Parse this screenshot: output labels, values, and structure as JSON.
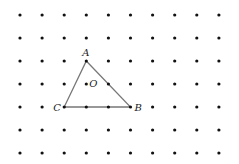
{
  "grid": {
    "cols": 10,
    "rows": 7,
    "x0": 20,
    "y0": 15,
    "dx": 22.1,
    "dy": 23,
    "dot_color": "#111"
  },
  "triangle": {
    "line_color": "#777",
    "vertices": [
      {
        "name": "A",
        "col": 3,
        "row": 2,
        "label_dx": -4,
        "label_dy": -5
      },
      {
        "name": "B",
        "col": 5,
        "row": 4,
        "label_dx": 4,
        "label_dy": 4
      },
      {
        "name": "C",
        "col": 2,
        "row": 4,
        "label_dx": -11,
        "label_dy": 4
      }
    ]
  },
  "point_O": {
    "name": "O",
    "col": 3,
    "row": 3,
    "label_dx": 3,
    "label_dy": 3
  }
}
